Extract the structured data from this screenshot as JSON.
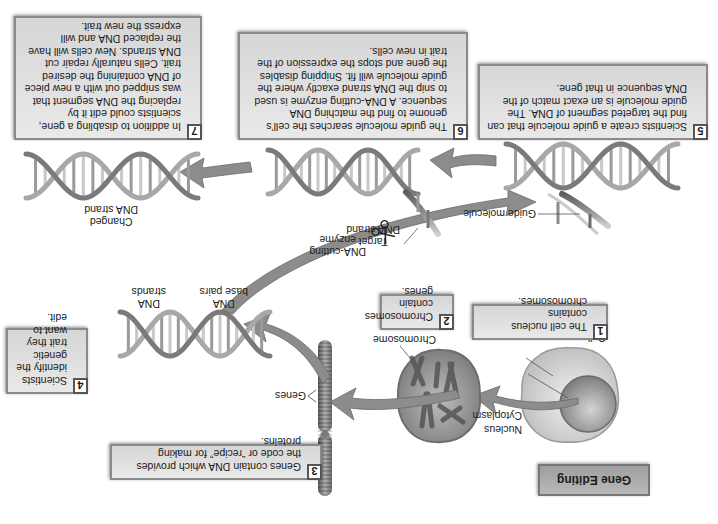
{
  "title": "Gene Editing",
  "steps": [
    {
      "number": "1",
      "text": "The cell nucleus contains chromosomes."
    },
    {
      "number": "2",
      "text": "Chromosomes contain genes."
    },
    {
      "number": "3",
      "text": "Genes contain DNA which provides the code or “recipe” for making proteins."
    },
    {
      "number": "4",
      "text": "Scientists identify the genetic trait they want to edit."
    },
    {
      "number": "5",
      "text": "Scientists create a guide molecule that can find the targeted segment of DNA. The guide molecule is an exact match of the DNA sequence in that gene."
    },
    {
      "number": "6",
      "text": "The guide molecule searches the cell’s genome to find the matching DNA sequence. A DNA-cutting enzyme is used to snip the DNA strand exactly where the guide molecule will fit. Snipping disables the gene and stops the expression of the trait in new cells."
    },
    {
      "number": "7",
      "text": "In addition to disabling a gene, scientists could edit it by replacing the DNA segment that was snipped out with a new piece of DNA containing the desired trait. Cells naturally repair cut DNA strands. New cells will have the replaced DNA and will express the new trait."
    }
  ],
  "labels": {
    "cell": "Cell",
    "nucleus": "Nucleus",
    "cytoplasm": "Cytoplasm",
    "chromosome": "Chromosome",
    "genes": "Genes",
    "dna_base_pairs": "DNA\nbase pairs",
    "dna_strands": "DNA\nstrands",
    "guide_molecule": "Guide molecule",
    "dna_cutting_enzyme": "DNA-cutting\nenzyme",
    "target_dna_strand": "Target\nDNA strand",
    "changed_dna_strand": "Changed\nDNA strand"
  },
  "icons": {
    "scissors": "scissors-icon"
  },
  "colors": {
    "box_fill": "#dcdcdc",
    "box_border": "#8a8a8a",
    "arrow": "#8c8c8c",
    "title_fill": "#aaaaaa"
  }
}
